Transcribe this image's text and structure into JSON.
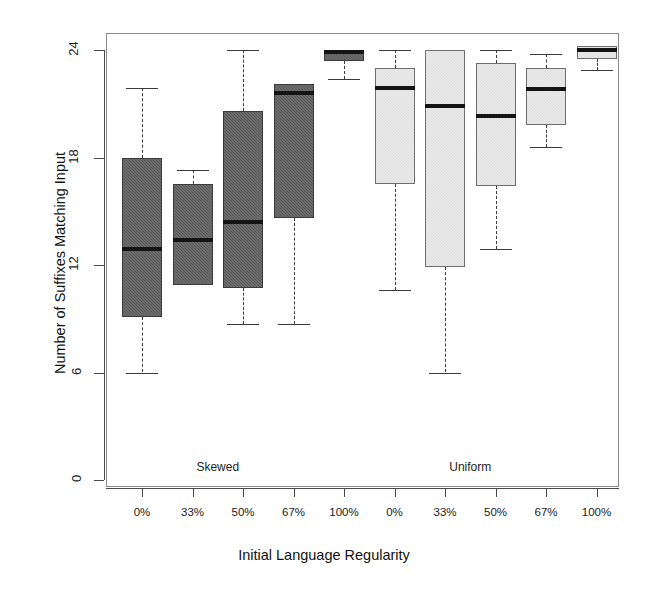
{
  "chart_data": {
    "type": "boxplot",
    "title": "",
    "xlabel": "Initial Language Regularity",
    "ylabel": "Number of Suffixes Matching Input",
    "ylim": [
      0,
      24
    ],
    "yticks": [
      0,
      6,
      12,
      18,
      24
    ],
    "yticklabels": [
      "0",
      "6",
      "12",
      "18",
      "24"
    ],
    "grid": false,
    "legend": false,
    "categories": [
      "0%",
      "33%",
      "50%",
      "67%",
      "100%",
      "0%",
      "33%",
      "50%",
      "67%",
      "100%"
    ],
    "groups": [
      {
        "name": "Skewed",
        "fill": "#5a5a5a",
        "categories": [
          "0%",
          "33%",
          "50%",
          "67%",
          "100%"
        ]
      },
      {
        "name": "Uniform",
        "fill": "#ebebeb",
        "categories": [
          "0%",
          "33%",
          "50%",
          "67%",
          "100%"
        ]
      }
    ],
    "boxes": [
      {
        "group": "Skewed",
        "category": "0%",
        "whisker_low": 6.0,
        "q1": 9.1,
        "median": 12.9,
        "q3": 18.0,
        "whisker_high": 21.9,
        "style": "dark"
      },
      {
        "group": "Skewed",
        "category": "33%",
        "whisker_low": 10.9,
        "q1": 10.9,
        "median": 13.4,
        "q3": 16.5,
        "whisker_high": 17.3,
        "style": "dark"
      },
      {
        "group": "Skewed",
        "category": "50%",
        "whisker_low": 8.7,
        "q1": 10.7,
        "median": 14.4,
        "q3": 20.6,
        "whisker_high": 24.0,
        "style": "dark"
      },
      {
        "group": "Skewed",
        "category": "67%",
        "whisker_low": 8.7,
        "q1": 14.6,
        "median": 21.6,
        "q3": 22.1,
        "whisker_high": 22.1,
        "style": "dark"
      },
      {
        "group": "Skewed",
        "category": "100%",
        "whisker_low": 22.4,
        "q1": 23.4,
        "median": 23.9,
        "q3": 24.0,
        "whisker_high": 24.0,
        "style": "dark"
      },
      {
        "group": "Uniform",
        "category": "0%",
        "whisker_low": 10.6,
        "q1": 16.5,
        "median": 21.9,
        "q3": 23.0,
        "whisker_high": 24.0,
        "style": "light"
      },
      {
        "group": "Uniform",
        "category": "33%",
        "whisker_low": 6.0,
        "q1": 11.9,
        "median": 20.9,
        "q3": 24.0,
        "whisker_high": 24.0,
        "style": "light"
      },
      {
        "group": "Uniform",
        "category": "50%",
        "whisker_low": 12.9,
        "q1": 16.4,
        "median": 20.3,
        "q3": 23.3,
        "whisker_high": 24.0,
        "style": "light"
      },
      {
        "group": "Uniform",
        "category": "67%",
        "whisker_low": 18.6,
        "q1": 19.8,
        "median": 21.8,
        "q3": 23.0,
        "whisker_high": 23.8,
        "style": "light"
      },
      {
        "group": "Uniform",
        "category": "100%",
        "whisker_low": 22.9,
        "q1": 23.5,
        "median": 24.0,
        "q3": 24.2,
        "whisker_high": 23.5,
        "style": "light"
      }
    ]
  },
  "axes": {
    "y_title": "Number of Suffixes Matching Input",
    "x_title": "Initial Language Regularity",
    "y_ticks": [
      "0",
      "6",
      "12",
      "18",
      "24"
    ],
    "x_ticks": [
      "0%",
      "33%",
      "50%",
      "67%",
      "100%",
      "0%",
      "33%",
      "50%",
      "67%",
      "100%"
    ]
  },
  "annotations": {
    "group_left": "Skewed",
    "group_right": "Uniform"
  },
  "colors": {
    "skewed_fill": "#5a5a5a",
    "uniform_fill": "#ebebeb",
    "median_line": "#141414",
    "axis": "#4a4a4a",
    "frame": "#8b8b8b"
  }
}
